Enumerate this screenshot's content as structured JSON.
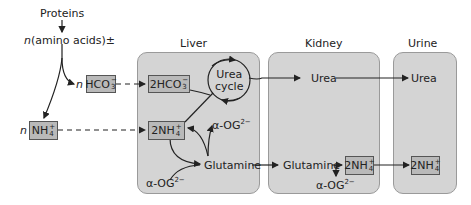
{
  "organs": {
    "liver": {
      "label": "Liver"
    },
    "kidney": {
      "label": "Kidney"
    },
    "urine": {
      "label": "Urine"
    }
  },
  "source": {
    "proteins": "Proteins",
    "amino_acids_n": "n",
    "amino_acids": "(amino acids)±"
  },
  "nodes": {
    "n_hco3_coef": "n",
    "hco3": {
      "base": "HCO",
      "sub": "3",
      "sup": "−"
    },
    "n_nh4_coef": "n",
    "nh4": {
      "base": "NH",
      "sub": "4",
      "sup": "+"
    },
    "liver_2hco3": {
      "base": "2HCO",
      "sub": "3",
      "sup": "−"
    },
    "urea_cycle_line1": "Urea",
    "urea_cycle_line2": "cycle",
    "liver_2nh4": {
      "base": "2NH",
      "sub": "4",
      "sup": "+"
    },
    "alpha_og_out": {
      "base": "α-OG",
      "sup": "2−"
    },
    "alpha_og_in": {
      "base": "α-OG",
      "sup": "2−"
    },
    "liver_glutamine": "Glutamine",
    "kidney_urea": "Urea",
    "kidney_glutamine": "Glutamine",
    "kidney_2nh4": {
      "base": "2NH",
      "sub": "4",
      "sup": "+"
    },
    "kidney_alpha_og": {
      "base": "α-OG",
      "sup": "2−"
    },
    "urine_urea": "Urea",
    "urine_2nh4": {
      "base": "2NH",
      "sub": "4",
      "sup": "+"
    }
  },
  "colors": {
    "organ_fill": "#d4d4d4",
    "box_fill": "#b9b9b9",
    "line": "#222222"
  }
}
